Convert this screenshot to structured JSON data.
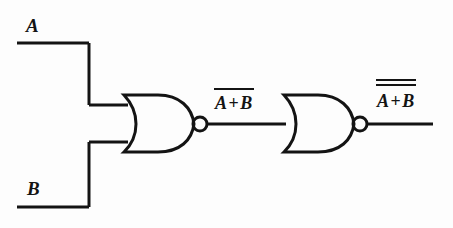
{
  "diagram": {
    "line_color": "#141414",
    "background_color": "#fdfdfd"
  },
  "inputs": [
    {
      "id": "input-a",
      "label": "A"
    },
    {
      "id": "input-b",
      "label": "B"
    }
  ],
  "gates": [
    {
      "id": "gate-1",
      "type": "nor",
      "inputs": 2,
      "label": "NOR"
    },
    {
      "id": "gate-2",
      "type": "nor",
      "inputs": 2,
      "label": "NOR"
    }
  ],
  "signals": {
    "intermediate": {
      "operand_left": "A",
      "operator": "+",
      "operand_right": "B",
      "overbars": 1,
      "text": "A + B"
    },
    "output": {
      "operand_left": "A",
      "operator": "+",
      "operand_right": "B",
      "overbars": 2,
      "text": "A + B"
    }
  }
}
